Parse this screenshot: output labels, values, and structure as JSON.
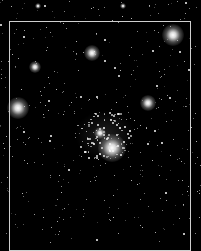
{
  "image": {
    "subject": "star cluster",
    "background": "#000000",
    "frame_color": "#cfcfcf"
  },
  "bright_stars": [
    {
      "x": 173,
      "y": 35,
      "r": 7
    },
    {
      "x": 92,
      "y": 53,
      "r": 5
    },
    {
      "x": 35,
      "y": 67,
      "r": 4
    },
    {
      "x": 18,
      "y": 108,
      "r": 7
    },
    {
      "x": 148,
      "y": 103,
      "r": 5
    },
    {
      "x": 112,
      "y": 148,
      "r": 9
    },
    {
      "x": 100,
      "y": 133,
      "r": 4
    },
    {
      "x": 38,
      "y": 6,
      "r": 2
    },
    {
      "x": 123,
      "y": 6,
      "r": 2
    }
  ],
  "cluster": {
    "cx": 105,
    "cy": 135,
    "rx": 30,
    "ry": 25,
    "count": 90
  },
  "field_star_count": 420
}
